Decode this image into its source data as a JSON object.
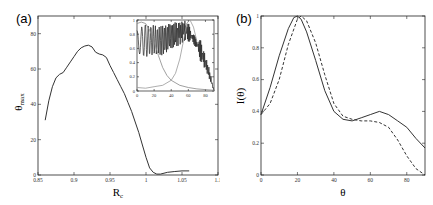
{
  "chart_data": [
    {
      "panel_label": "(a)",
      "type": "line",
      "title": "",
      "xlabel": "R_c",
      "ylabel": "θ_max",
      "xlim": [
        0.85,
        1.1
      ],
      "ylim": [
        0,
        90
      ],
      "xticks": [
        "0.85",
        "0.9",
        "0.95",
        "1",
        "1.05",
        "1.1"
      ],
      "yticks": [
        "0",
        "20",
        "40",
        "60",
        "80"
      ],
      "grid": false,
      "series": [
        {
          "name": "theta_max vs R_c",
          "style": "solid",
          "x": [
            0.86,
            0.865,
            0.87,
            0.875,
            0.88,
            0.885,
            0.89,
            0.895,
            0.9,
            0.905,
            0.91,
            0.915,
            0.92,
            0.925,
            0.93,
            0.935,
            0.94,
            0.945,
            0.95,
            0.955,
            0.96,
            0.965,
            0.97,
            0.975,
            0.98,
            0.985,
            0.99,
            0.995,
            1.0,
            1.005,
            1.01,
            1.015,
            1.02,
            1.025,
            1.03,
            1.04,
            1.05,
            1.06
          ],
          "y": [
            31,
            42,
            50,
            55,
            57,
            58,
            61,
            64,
            67,
            70,
            72,
            73,
            73.5,
            72.5,
            69.5,
            68.5,
            68,
            66.5,
            62,
            58,
            54,
            50,
            46,
            41,
            36,
            30,
            24,
            17,
            10,
            4,
            1.5,
            0.5,
            0.5,
            1,
            1.5,
            2,
            2.3,
            2.3
          ]
        }
      ],
      "inset": {
        "type": "line",
        "xlim": [
          0,
          90
        ],
        "ylim": [
          0,
          1
        ],
        "xticks": [
          "0",
          "20",
          "40",
          "60",
          "80"
        ],
        "yticks": [
          "0",
          "0.2",
          "0.4",
          "0.6",
          "0.8",
          "1"
        ],
        "series": [
          {
            "name": "oscillating intensity",
            "style": "solid-dark",
            "description": "rapid oscillations between ~0.45 and ~1.0 from θ=0 to ~85, envelope decaying to 0 near θ=90",
            "x": [
              0,
              5,
              10,
              15,
              20,
              25,
              30,
              35,
              40,
              45,
              50,
              55,
              60,
              65,
              70,
              75,
              80,
              85,
              90
            ],
            "y_upper": [
              0.85,
              0.9,
              0.95,
              0.92,
              0.93,
              0.9,
              0.92,
              0.94,
              0.95,
              0.97,
              0.98,
              1.0,
              0.95,
              0.9,
              0.82,
              0.7,
              0.5,
              0.3,
              0.0
            ],
            "y_lower": [
              0.55,
              0.5,
              0.48,
              0.5,
              0.5,
              0.52,
              0.5,
              0.55,
              0.58,
              0.6,
              0.65,
              0.7,
              0.7,
              0.6,
              0.5,
              0.4,
              0.3,
              0.15,
              0.0
            ]
          },
          {
            "name": "decaying curve",
            "style": "solid-gray",
            "x": [
              0,
              5,
              10,
              15,
              20,
              25,
              30,
              35,
              40,
              50,
              60,
              70,
              80,
              90
            ],
            "y": [
              0.95,
              0.97,
              0.95,
              0.85,
              0.7,
              0.5,
              0.33,
              0.22,
              0.15,
              0.08,
              0.05,
              0.03,
              0.02,
              0.01
            ]
          },
          {
            "name": "rising curve",
            "style": "solid-gray-wavy",
            "x": [
              0,
              10,
              20,
              30,
              40,
              45,
              50,
              55,
              58,
              62,
              66,
              70
            ],
            "y": [
              0.05,
              0.04,
              0.06,
              0.08,
              0.15,
              0.25,
              0.45,
              0.75,
              0.95,
              1.0,
              0.9,
              0.7
            ]
          }
        ]
      }
    },
    {
      "panel_label": "(b)",
      "type": "line",
      "title": "",
      "xlabel": "θ",
      "ylabel": "I(θ)",
      "xlim": [
        0,
        90
      ],
      "ylim": [
        0,
        1
      ],
      "xticks": [
        "0",
        "20",
        "40",
        "60",
        "80"
      ],
      "yticks": [
        "0",
        "0.2",
        "0.4",
        "0.6",
        "0.8",
        "1"
      ],
      "grid": false,
      "series": [
        {
          "name": "solid",
          "style": "solid",
          "x": [
            0,
            5,
            10,
            15,
            18,
            20,
            22,
            25,
            30,
            35,
            40,
            45,
            50,
            55,
            60,
            65,
            70,
            75,
            80,
            85,
            90
          ],
          "y": [
            0.38,
            0.55,
            0.75,
            0.92,
            0.99,
            1.0,
            0.98,
            0.9,
            0.72,
            0.53,
            0.4,
            0.35,
            0.34,
            0.36,
            0.38,
            0.4,
            0.38,
            0.34,
            0.3,
            0.23,
            0.17
          ]
        },
        {
          "name": "dashed",
          "style": "dashed",
          "x": [
            0,
            5,
            10,
            15,
            20,
            22,
            25,
            30,
            35,
            40,
            45,
            50,
            55,
            60,
            65,
            70,
            75,
            80,
            85,
            90
          ],
          "y": [
            0.38,
            0.45,
            0.6,
            0.82,
            0.98,
            1.0,
            0.97,
            0.83,
            0.63,
            0.45,
            0.37,
            0.35,
            0.34,
            0.34,
            0.33,
            0.3,
            0.22,
            0.12,
            0.04,
            0.0
          ]
        }
      ]
    }
  ]
}
